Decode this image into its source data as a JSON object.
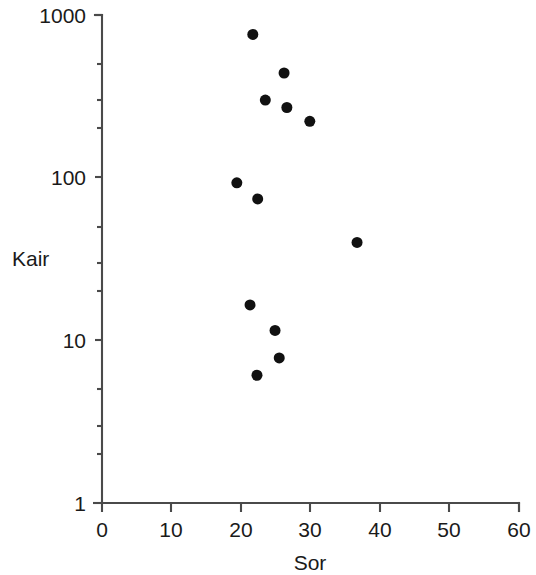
{
  "chart_data": {
    "type": "scatter",
    "title": "",
    "xlabel": "Sor",
    "ylabel": "Kair",
    "xlim": [
      0,
      60
    ],
    "ylim": [
      1,
      1000
    ],
    "xscale": "linear",
    "yscale": "log",
    "grid": false,
    "legend": null,
    "xticks": [
      0,
      10,
      20,
      30,
      40,
      50,
      60
    ],
    "xtick_labels": [
      "0",
      "10",
      "20",
      "30",
      "40",
      "50",
      "60"
    ],
    "yticks": [
      1,
      10,
      100,
      1000
    ],
    "ytick_labels": [
      "1",
      "10",
      "100",
      "1000"
    ],
    "y_minor_ticks": [
      2,
      3,
      5,
      20,
      30,
      50,
      200,
      300,
      500
    ],
    "marker": "filled-circle",
    "marker_color": "#111111",
    "marker_size_px": 11,
    "n_points": 12,
    "points": [
      {
        "x": 21.7,
        "y": 760
      },
      {
        "x": 26.2,
        "y": 440
      },
      {
        "x": 23.5,
        "y": 300
      },
      {
        "x": 26.6,
        "y": 270
      },
      {
        "x": 29.9,
        "y": 222
      },
      {
        "x": 19.4,
        "y": 93
      },
      {
        "x": 22.4,
        "y": 74
      },
      {
        "x": 36.7,
        "y": 40
      },
      {
        "x": 21.3,
        "y": 16.5
      },
      {
        "x": 24.9,
        "y": 11.5
      },
      {
        "x": 25.5,
        "y": 7.8
      },
      {
        "x": 22.3,
        "y": 6.1
      }
    ]
  },
  "axes": {
    "x_title": "Sor",
    "y_title": "Kair",
    "x_tick_labels": [
      "0",
      "10",
      "20",
      "30",
      "40",
      "50",
      "60"
    ],
    "y_tick_labels": [
      "1000",
      "100",
      "10",
      "1"
    ]
  }
}
